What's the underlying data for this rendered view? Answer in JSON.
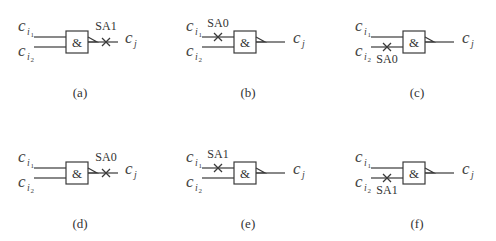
{
  "figure": {
    "gate_symbol": "&",
    "input_label_base": "c",
    "input_sub": "i",
    "input1_index": "1",
    "input2_index": "2",
    "output_label_base": "c",
    "output_sub": "j",
    "panels": [
      {
        "id": "a",
        "caption": "(a)",
        "fault": "SA1",
        "fault_line": "output",
        "x": 0,
        "y": 0
      },
      {
        "id": "b",
        "caption": "(b)",
        "fault": "SA0",
        "fault_line": "input1",
        "x": 168,
        "y": 0
      },
      {
        "id": "c",
        "caption": "(c)",
        "fault": "SA0",
        "fault_line": "input2",
        "x": 337,
        "y": 0
      },
      {
        "id": "d",
        "caption": "(d)",
        "fault": "SA0",
        "fault_line": "output",
        "x": 0,
        "y": 131
      },
      {
        "id": "e",
        "caption": "(e)",
        "fault": "SA1",
        "fault_line": "input1",
        "x": 168,
        "y": 131
      },
      {
        "id": "f",
        "caption": "(f)",
        "fault": "SA1",
        "fault_line": "input2",
        "x": 337,
        "y": 131
      }
    ]
  }
}
